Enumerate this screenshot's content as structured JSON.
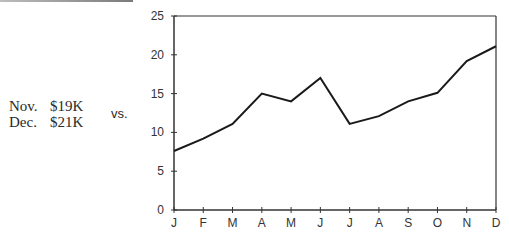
{
  "summary": {
    "rows": [
      {
        "month": "Nov.",
        "value": "$19K"
      },
      {
        "month": "Dec.",
        "value": "$21K"
      }
    ],
    "vs_label": "vs."
  },
  "chart_data": {
    "type": "line",
    "title": "",
    "xlabel": "",
    "ylabel": "",
    "categories": [
      "J",
      "F",
      "M",
      "A",
      "M",
      "J",
      "J",
      "A",
      "S",
      "O",
      "N",
      "D"
    ],
    "series": [
      {
        "name": "Monthly value ($K)",
        "values": [
          7.6,
          9.2,
          11.1,
          15.0,
          14.0,
          17.0,
          11.1,
          12.1,
          14.0,
          15.1,
          19.2,
          21.1
        ]
      }
    ],
    "yticks": [
      0,
      5,
      10,
      15,
      20,
      25
    ],
    "ylim": [
      0,
      25
    ],
    "grid": false,
    "legend": "none",
    "colors": {
      "line": "#1a1a1a",
      "axis": "#333333"
    }
  }
}
